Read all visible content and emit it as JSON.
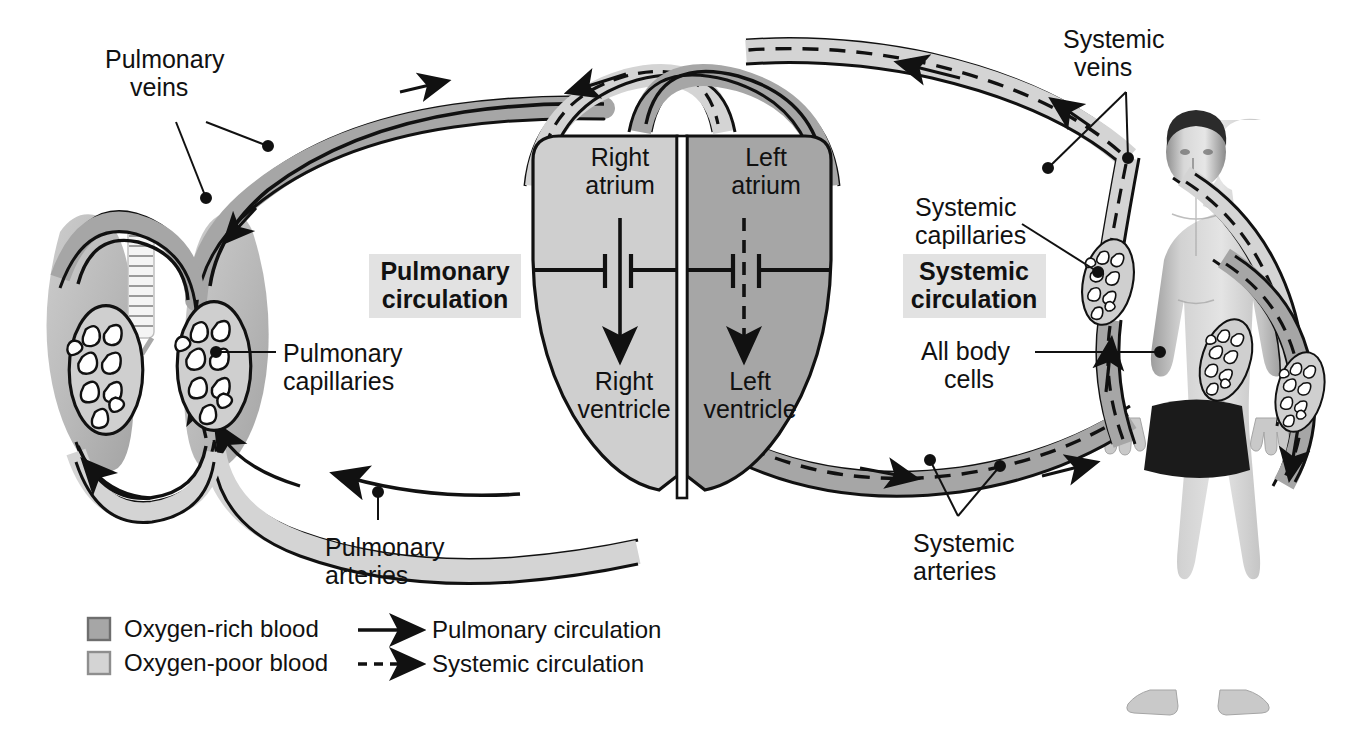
{
  "figure": {
    "type": "anatomical-flow-diagram"
  },
  "section_titles": [
    {
      "id": "pulmonary",
      "line1": "Pulmonary",
      "line2": "circulation",
      "bg": "#e2e2e2"
    },
    {
      "id": "systemic",
      "line1": "Systemic",
      "line2": "circulation",
      "bg": "#e2e2e2"
    }
  ],
  "heart": {
    "chambers": [
      {
        "id": "right-atrium",
        "line1": "Right",
        "line2": "atrium",
        "fill": "#cfcfcf"
      },
      {
        "id": "left-atrium",
        "line1": "Left",
        "line2": "atrium",
        "fill": "#a6a6a6"
      },
      {
        "id": "right-ventricle",
        "line1": "Right",
        "line2": "ventricle",
        "fill": "#cfcfcf"
      },
      {
        "id": "left-ventricle",
        "line1": "Left",
        "line2": "ventricle",
        "fill": "#a6a6a6"
      }
    ],
    "septum_color": "#ffffff"
  },
  "labels": [
    {
      "id": "pulmonary-veins",
      "line1": "Pulmonary",
      "line2": "veins",
      "x": 105,
      "y": 60,
      "anchor": "start"
    },
    {
      "id": "pulmonary-capillaries",
      "line1": "Pulmonary",
      "line2": "capillaries",
      "x": 283,
      "y": 340,
      "anchor": "start"
    },
    {
      "id": "pulmonary-arteries",
      "line1": "Pulmonary",
      "line2": "arteries",
      "x": 325,
      "y": 533,
      "anchor": "start"
    },
    {
      "id": "systemic-veins",
      "line1": "Systemic",
      "line2": "veins",
      "x": 1063,
      "y": 28,
      "anchor": "start"
    },
    {
      "id": "systemic-capillaries",
      "line1": "Systemic",
      "line2": "capillaries",
      "x": 915,
      "y": 196,
      "anchor": "start"
    },
    {
      "id": "all-body-cells",
      "line1": "All body",
      "line2": "cells",
      "x": 921,
      "y": 338,
      "anchor": "start"
    },
    {
      "id": "systemic-arteries",
      "line1": "Systemic",
      "line2": "arteries",
      "x": 913,
      "y": 528,
      "anchor": "start"
    }
  ],
  "legend": {
    "swatches": [
      {
        "id": "oxygen-rich",
        "label": "Oxygen-rich blood",
        "color": "#a6a6a6"
      },
      {
        "id": "oxygen-poor",
        "label": "Oxygen-poor blood",
        "color": "#d4d4d4"
      }
    ],
    "arrows": [
      {
        "id": "pulmonary-circulation",
        "label": "Pulmonary circulation",
        "style": "solid"
      },
      {
        "id": "systemic-circulation",
        "label": "Systemic circulation",
        "style": "dashed"
      }
    ]
  },
  "colors": {
    "oxygen_rich": "#a6a6a6",
    "oxygen_poor": "#d4d4d4",
    "outline": "#111111",
    "lung_tissue": "#b4b4b4",
    "trachea": "#f2f2f2",
    "skin": "#cdcdcd",
    "shorts": "#1a1a1a",
    "hair": "#2a2a2a",
    "background": "#ffffff"
  }
}
